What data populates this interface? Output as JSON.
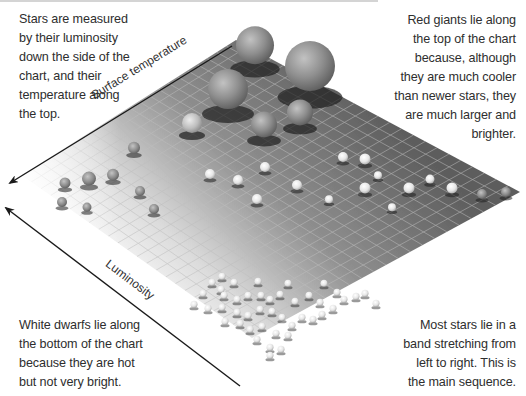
{
  "captions": {
    "top_left": [
      "Stars are measured",
      "by their luminosity",
      "down the side of the",
      "chart, and their",
      "temperature along",
      "the top."
    ],
    "top_right": [
      "Red giants lie along",
      "the top of the chart",
      "because, although",
      "they are much cooler",
      "than newer stars, they",
      "are much larger and",
      "brighter."
    ],
    "bottom_left": [
      "White dwarfs lie along",
      "the bottom of the chart",
      "because they are hot",
      "but not very bright."
    ],
    "bottom_right": [
      "Most stars lie in a",
      "band stretching from",
      "left to right. This is",
      "the main sequence."
    ]
  },
  "axes": {
    "temperature_label": "Surface temperature",
    "luminosity_label": "Luminosity"
  },
  "colors": {
    "plane_dark": "#5e5e5e",
    "plane_light": "#f4f4f4",
    "grid": "#b9b9b9",
    "arrow": "#1a1a1a",
    "text": "#2e2e2e"
  },
  "plane": {
    "top": [
      236,
      40
    ],
    "right": [
      520,
      192
    ],
    "bottom": [
      252,
      338
    ],
    "left": [
      22,
      175
    ]
  },
  "stars": {
    "red_giants": [
      {
        "x": 255,
        "y": 49,
        "r": 19
      },
      {
        "x": 310,
        "y": 71,
        "r": 25
      },
      {
        "x": 228,
        "y": 93,
        "r": 20
      },
      {
        "x": 264,
        "y": 127,
        "r": 13
      },
      {
        "x": 300,
        "y": 115,
        "r": 13
      },
      {
        "x": 192,
        "y": 125,
        "r": 10
      }
    ],
    "main_sequence": [
      {
        "x": 134,
        "y": 149,
        "r": 6
      },
      {
        "x": 113,
        "y": 176,
        "r": 6
      },
      {
        "x": 89,
        "y": 180,
        "r": 7
      },
      {
        "x": 65,
        "y": 184,
        "r": 5.5
      },
      {
        "x": 140,
        "y": 192,
        "r": 5
      },
      {
        "x": 62,
        "y": 203,
        "r": 5
      },
      {
        "x": 87,
        "y": 208,
        "r": 4.5
      },
      {
        "x": 154,
        "y": 210,
        "r": 5
      },
      {
        "x": 210,
        "y": 175,
        "r": 5
      },
      {
        "x": 238,
        "y": 181,
        "r": 5
      },
      {
        "x": 265,
        "y": 168,
        "r": 5
      },
      {
        "x": 257,
        "y": 200,
        "r": 5
      },
      {
        "x": 297,
        "y": 186,
        "r": 5
      },
      {
        "x": 329,
        "y": 200,
        "r": 4
      },
      {
        "x": 343,
        "y": 158,
        "r": 5
      },
      {
        "x": 365,
        "y": 160,
        "r": 5.5
      },
      {
        "x": 378,
        "y": 176,
        "r": 4
      },
      {
        "x": 365,
        "y": 189,
        "r": 5.5
      },
      {
        "x": 392,
        "y": 208,
        "r": 4
      },
      {
        "x": 409,
        "y": 189,
        "r": 5.5
      },
      {
        "x": 430,
        "y": 180,
        "r": 4.5
      },
      {
        "x": 452,
        "y": 189,
        "r": 5.5
      },
      {
        "x": 482,
        "y": 195,
        "r": 5
      },
      {
        "x": 506,
        "y": 193,
        "r": 5
      }
    ],
    "white_dwarfs": [
      {
        "x": 222,
        "y": 277
      },
      {
        "x": 234,
        "y": 283
      },
      {
        "x": 212,
        "y": 283
      },
      {
        "x": 221,
        "y": 290
      },
      {
        "x": 258,
        "y": 282
      },
      {
        "x": 288,
        "y": 284
      },
      {
        "x": 324,
        "y": 284
      },
      {
        "x": 203,
        "y": 294
      },
      {
        "x": 224,
        "y": 296
      },
      {
        "x": 237,
        "y": 300
      },
      {
        "x": 248,
        "y": 296
      },
      {
        "x": 261,
        "y": 296
      },
      {
        "x": 270,
        "y": 300
      },
      {
        "x": 280,
        "y": 295
      },
      {
        "x": 295,
        "y": 302
      },
      {
        "x": 309,
        "y": 296
      },
      {
        "x": 337,
        "y": 293
      },
      {
        "x": 344,
        "y": 300
      },
      {
        "x": 302,
        "y": 318
      },
      {
        "x": 320,
        "y": 303
      },
      {
        "x": 333,
        "y": 309
      },
      {
        "x": 356,
        "y": 297
      },
      {
        "x": 365,
        "y": 294
      },
      {
        "x": 376,
        "y": 304
      },
      {
        "x": 194,
        "y": 305
      },
      {
        "x": 208,
        "y": 309
      },
      {
        "x": 222,
        "y": 308
      },
      {
        "x": 237,
        "y": 313
      },
      {
        "x": 248,
        "y": 316
      },
      {
        "x": 260,
        "y": 310
      },
      {
        "x": 272,
        "y": 312
      },
      {
        "x": 282,
        "y": 318
      },
      {
        "x": 292,
        "y": 326
      },
      {
        "x": 313,
        "y": 320
      },
      {
        "x": 322,
        "y": 315
      },
      {
        "x": 225,
        "y": 322
      },
      {
        "x": 240,
        "y": 324
      },
      {
        "x": 250,
        "y": 330
      },
      {
        "x": 262,
        "y": 327
      },
      {
        "x": 276,
        "y": 334
      },
      {
        "x": 288,
        "y": 336
      },
      {
        "x": 257,
        "y": 340
      },
      {
        "x": 270,
        "y": 348
      },
      {
        "x": 281,
        "y": 350
      },
      {
        "x": 270,
        "y": 356
      }
    ]
  }
}
